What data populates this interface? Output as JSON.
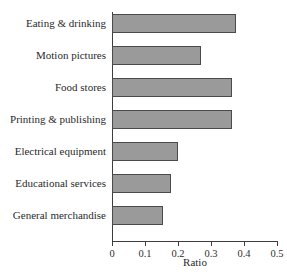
{
  "chart": {
    "title": "",
    "axis_title": "Ratio",
    "bar_fill_color": "#9a9a9a",
    "bar_border_color": "#4a4a4a",
    "axis_color": "#3d3d3d",
    "background_color": "#ffffff"
  },
  "chart_data": {
    "type": "bar",
    "orientation": "horizontal",
    "title": "",
    "xlabel": "Ratio",
    "ylabel": "",
    "xlim": [
      0,
      0.5
    ],
    "xticks": [
      0,
      0.1,
      0.2,
      0.3,
      0.4,
      0.5
    ],
    "xtick_labels": [
      "0",
      "0.1",
      "0.2",
      "0.3",
      "0.4",
      "0.5"
    ],
    "grid": false,
    "legend": false,
    "categories": [
      "Eating & drinking",
      "Motion pictures",
      "Food stores",
      "Printing & publishing",
      "Electrical equipment",
      "Educational services",
      "General merchandise"
    ],
    "values": [
      0.375,
      0.27,
      0.365,
      0.365,
      0.2,
      0.18,
      0.155
    ]
  }
}
